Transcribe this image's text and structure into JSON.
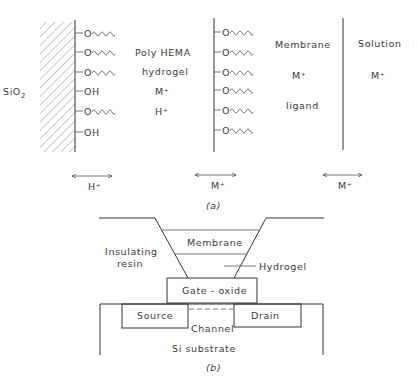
{
  "panel_a": {
    "caption": "(a)",
    "substrate_label": "SiO",
    "substrate_subscript": "2",
    "left_wall_groups": [
      "O~",
      "O~",
      "O~",
      "OH",
      "O~",
      "OH"
    ],
    "hydrogel_region": {
      "line1": "Poly HEMA",
      "line2": "hydrogel",
      "ion1": "M⁺",
      "ion2": "H⁺"
    },
    "membrane_groups": [
      "O~",
      "O~",
      "O~",
      "O~",
      "O~",
      "O~"
    ],
    "membrane_region": {
      "line1": "Membrane",
      "ion": "M⁺",
      "line2": "ligand"
    },
    "solution_region": {
      "label": "Solution",
      "ion": "M⁺"
    },
    "exchange_arrows": [
      {
        "label": "H⁺"
      },
      {
        "label": "M⁺"
      },
      {
        "label": "M⁺"
      }
    ],
    "oh_label": "OH",
    "o_label": "O"
  },
  "panel_b": {
    "caption": "(b)",
    "labels": {
      "insulating_1": "Insulating",
      "insulating_2": "resin",
      "membrane": "Membrane",
      "hydrogel": "Hydrogel",
      "gate_oxide": "Gate - oxide",
      "source": "Source",
      "drain": "Drain",
      "channel": "Channel",
      "substrate": "Si substrate"
    }
  }
}
